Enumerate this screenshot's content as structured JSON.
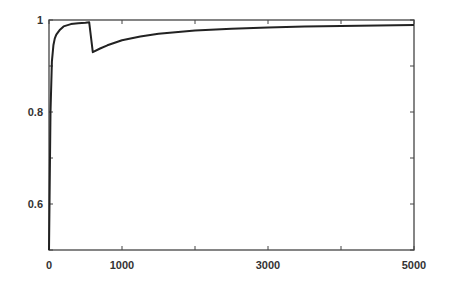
{
  "chart_data": {
    "type": "line",
    "title": "",
    "xlabel": "",
    "ylabel": "",
    "xlim": [
      0,
      5000
    ],
    "ylim": [
      0.5,
      1.0
    ],
    "grid": false,
    "legend": null,
    "x_ticks": [
      0,
      1000,
      2000,
      3000,
      4000,
      5000
    ],
    "x_tick_labels": [
      "0",
      "1000",
      "",
      "3000",
      "",
      "5000"
    ],
    "y_ticks": [
      0.5,
      0.6,
      0.7,
      0.8,
      0.9,
      1.0
    ],
    "y_tick_labels": [
      "",
      "0.6",
      "",
      "0.8",
      "",
      "1"
    ],
    "series": [
      {
        "name": "curve",
        "color": "#222222",
        "x": [
          0,
          20,
          40,
          60,
          80,
          100,
          150,
          200,
          300,
          400,
          500,
          550,
          600,
          700,
          800,
          1000,
          1250,
          1500,
          2000,
          2500,
          3000,
          3500,
          4000,
          4500,
          5000
        ],
        "y": [
          0.5,
          0.8,
          0.91,
          0.945,
          0.96,
          0.968,
          0.979,
          0.986,
          0.991,
          0.993,
          0.994,
          0.995,
          0.93,
          0.938,
          0.945,
          0.956,
          0.964,
          0.97,
          0.977,
          0.981,
          0.984,
          0.986,
          0.987,
          0.988,
          0.989
        ]
      }
    ]
  }
}
